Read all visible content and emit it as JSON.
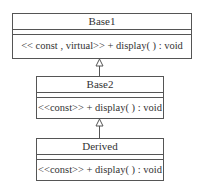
{
  "diagram": {
    "type": "uml-class-inheritance",
    "classes": [
      {
        "name": "Base1",
        "attributes": [],
        "operations": [
          "<< const , virtual>> + display( ) : void"
        ]
      },
      {
        "name": "Base2",
        "attributes": [],
        "operations": [
          "<<const>> + display( ) : void"
        ]
      },
      {
        "name": "Derived",
        "attributes": [],
        "operations": [
          "<<const>> + display( ) : void"
        ]
      }
    ],
    "relations": [
      {
        "from": "Base2",
        "to": "Base1",
        "type": "generalization"
      },
      {
        "from": "Derived",
        "to": "Base2",
        "type": "generalization"
      }
    ]
  }
}
